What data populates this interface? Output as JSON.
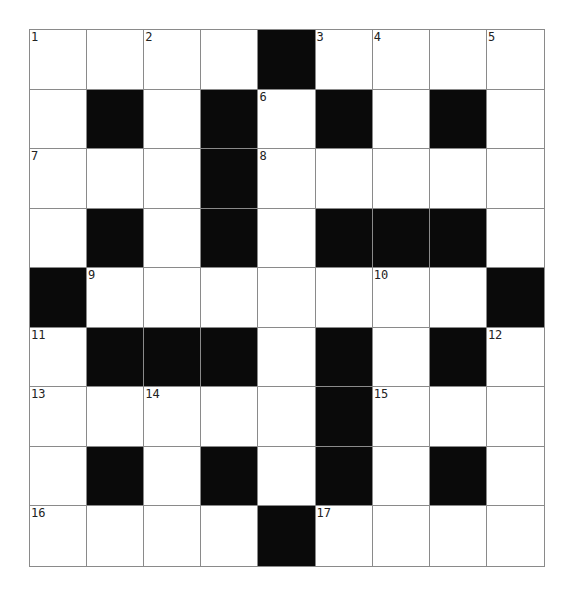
{
  "puzzle": {
    "rows": 9,
    "cols": 9,
    "colors": {
      "block": "#0a0a0a",
      "cell": "#ffffff",
      "gridline": "#8a8a8a",
      "number": "#222222"
    },
    "grid": [
      [
        {
          "n": "1"
        },
        {},
        {
          "n": "2"
        },
        {},
        {
          "b": true
        },
        {
          "n": "3"
        },
        {
          "n": "4"
        },
        {},
        {
          "n": "5"
        }
      ],
      [
        {},
        {
          "b": true
        },
        {},
        {
          "b": true
        },
        {
          "n": "6"
        },
        {
          "b": true
        },
        {},
        {
          "b": true
        },
        {}
      ],
      [
        {
          "n": "7"
        },
        {},
        {},
        {
          "b": true
        },
        {
          "n": "8"
        },
        {},
        {},
        {},
        {}
      ],
      [
        {},
        {
          "b": true
        },
        {},
        {
          "b": true
        },
        {},
        {
          "b": true
        },
        {
          "b": true
        },
        {
          "b": true
        },
        {}
      ],
      [
        {
          "b": true
        },
        {
          "n": "9"
        },
        {},
        {},
        {},
        {},
        {
          "n": "10"
        },
        {},
        {
          "b": true
        }
      ],
      [
        {
          "n": "11"
        },
        {
          "b": true
        },
        {
          "b": true
        },
        {
          "b": true
        },
        {},
        {
          "b": true
        },
        {},
        {
          "b": true
        },
        {
          "n": "12"
        }
      ],
      [
        {
          "n": "13"
        },
        {},
        {
          "n": "14"
        },
        {},
        {},
        {
          "b": true
        },
        {
          "n": "15"
        },
        {},
        {}
      ],
      [
        {},
        {
          "b": true
        },
        {},
        {
          "b": true
        },
        {},
        {
          "b": true
        },
        {},
        {
          "b": true
        },
        {}
      ],
      [
        {
          "n": "16"
        },
        {},
        {},
        {},
        {
          "b": true
        },
        {
          "n": "17"
        },
        {},
        {},
        {}
      ]
    ]
  }
}
